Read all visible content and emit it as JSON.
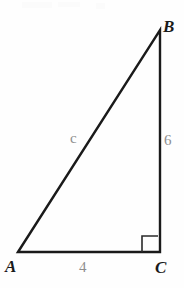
{
  "figure": {
    "type": "right-triangle-diagram",
    "background_color": "#fefefe",
    "stroke_color": "#1a1a1a",
    "label_color": "#1a1a1a",
    "measure_color": "#8e8e8e",
    "width": 184,
    "height": 288
  },
  "vertices": {
    "a": {
      "label": "A",
      "x": 18,
      "y": 252
    },
    "b": {
      "label": "B",
      "x": 160,
      "y": 30
    },
    "c": {
      "label": "C",
      "x": 160,
      "y": 252
    }
  },
  "sides": {
    "hypotenuse": {
      "label": "c",
      "from": "A",
      "to": "B"
    },
    "vertical": {
      "label": "6",
      "from": "B",
      "to": "C"
    },
    "base": {
      "label": "4",
      "from": "A",
      "to": "C"
    }
  },
  "markers": {
    "right_angle": {
      "at": "C",
      "label": "right-angle-marker"
    }
  }
}
